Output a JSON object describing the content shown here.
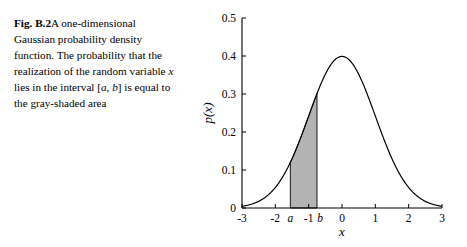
{
  "caption": {
    "label": "Fig. B.2",
    "text_part1": "A one-dimensional Gaussian probability density function. The probability that the realization of the random variable ",
    "var_x": "x",
    "text_part2": " lies in the interval [",
    "var_a": "a",
    "comma": ", ",
    "var_b": "b",
    "text_part3": "] is equal to the gray-shaded area"
  },
  "chart_data": {
    "type": "line",
    "title": "",
    "xlabel": "x",
    "ylabel": "p(x)",
    "xlim": [
      -3,
      3
    ],
    "ylim": [
      0,
      0.5
    ],
    "xticks": [
      "-3",
      "-2",
      "-1",
      "0",
      "1",
      "2",
      "3"
    ],
    "xtick_values": [
      -3,
      -2,
      -1,
      0,
      1,
      2,
      3
    ],
    "yticks": [
      "0",
      "0.1",
      "0.2",
      "0.3",
      "0.4",
      "0.5"
    ],
    "ytick_values": [
      0,
      0.1,
      0.2,
      0.3,
      0.4,
      0.5
    ],
    "grid": false,
    "legend": "none",
    "curve": {
      "name": "Gaussian pdf",
      "formula": "standard normal, mean 0, sd 1",
      "peak_value": 0.4,
      "color": "#000000"
    },
    "shaded_region": {
      "label_left": "a",
      "label_right": "b",
      "a": -1.55,
      "b": -0.75,
      "fill_color": "#b3b3b3",
      "edge_color": "#000000"
    },
    "x": [
      -3,
      -2.8,
      -2.6,
      -2.4,
      -2.2,
      -2,
      -1.8,
      -1.6,
      -1.4,
      -1.2,
      -1,
      -0.8,
      -0.6,
      -0.4,
      -0.2,
      0,
      0.2,
      0.4,
      0.6,
      0.8,
      1,
      1.2,
      1.4,
      1.6,
      1.8,
      2,
      2.2,
      2.4,
      2.6,
      2.8,
      3
    ],
    "y": [
      0.0044,
      0.0079,
      0.0136,
      0.0224,
      0.0355,
      0.054,
      0.079,
      0.1109,
      0.1497,
      0.1942,
      0.242,
      0.2897,
      0.3332,
      0.3683,
      0.391,
      0.3989,
      0.391,
      0.3683,
      0.3332,
      0.2897,
      0.242,
      0.1942,
      0.1497,
      0.1109,
      0.079,
      0.054,
      0.0355,
      0.0224,
      0.0136,
      0.0079,
      0.0044
    ]
  }
}
